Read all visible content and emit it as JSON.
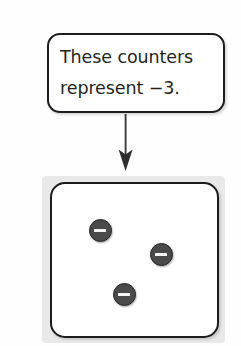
{
  "background_color": "#fefefe",
  "callout": {
    "text": "These counters\nrepresent −3.",
    "line1": "These counters",
    "line2": "represent −3.",
    "value": "−3",
    "border_color": "#1d1d1d",
    "fill_color": "#ffffff"
  },
  "arrow": {
    "name": "down-arrow",
    "direction": "down",
    "color": "#3a3a3a"
  },
  "counter_box": {
    "frame_color": "#e9e9e9",
    "fill_color": "#ffffff",
    "border_color": "#1c1c1c",
    "counter_count": 3,
    "counters": [
      {
        "sign": "−",
        "label": "negative-counter",
        "x": 89,
        "y": 219
      },
      {
        "sign": "−",
        "label": "negative-counter",
        "x": 150,
        "y": 243
      },
      {
        "sign": "−",
        "label": "negative-counter",
        "x": 113,
        "y": 283
      }
    ],
    "counter_fill": "#4a4a4a",
    "counter_border": "#262626",
    "counter_sign_color": "#f4f4f4"
  }
}
